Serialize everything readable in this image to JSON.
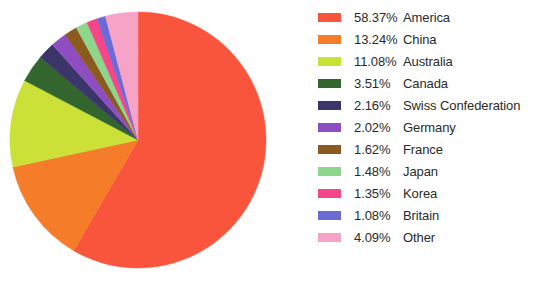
{
  "chart_data": {
    "type": "pie",
    "title": "",
    "legend_position": "right",
    "start_angle_deg": 0,
    "direction": "clockwise",
    "categories": [
      "America",
      "China",
      "Australia",
      "Canada",
      "Swiss Confederation",
      "Germany",
      "France",
      "Japan",
      "Korea",
      "Britain",
      "Other"
    ],
    "values": [
      58.37,
      13.24,
      11.08,
      3.51,
      2.16,
      2.02,
      1.62,
      1.48,
      1.35,
      1.08,
      4.09
    ],
    "value_suffix": "%",
    "colors": [
      "#f9553c",
      "#f57c28",
      "#cce137",
      "#33662f",
      "#3b3569",
      "#8e4ec1",
      "#8a5a1e",
      "#8ed68c",
      "#f5468a",
      "#6b6bd6",
      "#f7a3c8"
    ],
    "slices": [
      {
        "label": "America",
        "value": 58.37,
        "display": "58.37%",
        "color": "#f9553c"
      },
      {
        "label": "China",
        "value": 13.24,
        "display": "13.24%",
        "color": "#f57c28"
      },
      {
        "label": "Australia",
        "value": 11.08,
        "display": "11.08%",
        "color": "#cce137"
      },
      {
        "label": "Canada",
        "value": 3.51,
        "display": "3.51%",
        "color": "#33662f"
      },
      {
        "label": "Swiss Confederation",
        "value": 2.16,
        "display": "2.16%",
        "color": "#3b3569"
      },
      {
        "label": "Germany",
        "value": 2.02,
        "display": "2.02%",
        "color": "#8e4ec1"
      },
      {
        "label": "France",
        "value": 1.62,
        "display": "1.62%",
        "color": "#8a5a1e"
      },
      {
        "label": "Japan",
        "value": 1.48,
        "display": "1.48%",
        "color": "#8ed68c"
      },
      {
        "label": "Korea",
        "value": 1.35,
        "display": "1.35%",
        "color": "#f5468a"
      },
      {
        "label": "Britain",
        "value": 1.08,
        "display": "1.08%",
        "color": "#6b6bd6"
      },
      {
        "label": "Other",
        "value": 4.09,
        "display": "4.09%",
        "color": "#f7a3c8"
      }
    ]
  },
  "legend": {
    "entries": [
      {
        "value": "58.37%",
        "label": "America"
      },
      {
        "value": "13.24%",
        "label": "China"
      },
      {
        "value": "11.08%",
        "label": "Australia"
      },
      {
        "value": "3.51%",
        "label": "Canada"
      },
      {
        "value": "2.16%",
        "label": "Swiss Confederation"
      },
      {
        "value": "2.02%",
        "label": "Germany"
      },
      {
        "value": "1.62%",
        "label": "France"
      },
      {
        "value": "1.48%",
        "label": "Japan"
      },
      {
        "value": "1.35%",
        "label": "Korea"
      },
      {
        "value": "1.08%",
        "label": "Britain"
      },
      {
        "value": "4.09%",
        "label": "Other"
      }
    ]
  }
}
